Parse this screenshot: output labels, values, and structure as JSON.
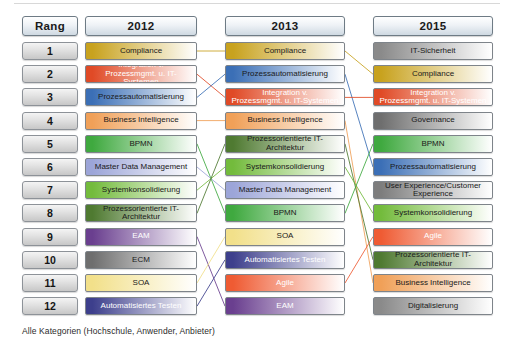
{
  "meta": {
    "footer_note": "Alle Kategorien (Hochschule, Anwender, Anbieter)"
  },
  "headers": {
    "rank": "Rang",
    "year_2012": "2012",
    "year_2013": "2013",
    "year_2015": "2015"
  },
  "ranks": [
    "1",
    "2",
    "3",
    "4",
    "5",
    "6",
    "7",
    "8",
    "9",
    "10",
    "11",
    "12"
  ],
  "chart_data": {
    "type": "table",
    "xlabel": "",
    "ylabel": "Rang",
    "grid": false,
    "legend": "none",
    "categories": [
      "1",
      "2",
      "3",
      "4",
      "5",
      "6",
      "7",
      "8",
      "9",
      "10",
      "11",
      "12"
    ],
    "columns": [
      "Rang",
      "2012",
      "2013",
      "2015"
    ],
    "series": [
      {
        "name": "2012",
        "values": [
          "Compliance",
          "Integration v. Prozessmgmt. u. IT-Systemen",
          "Prozessautomatisierung",
          "Business Intelligence",
          "BPMN",
          "Master Data Management",
          "Systemkonsolidierung",
          "Prozessorientierte IT-Architektur",
          "EAM",
          "ECM",
          "SOA",
          "Automatisiertes Testen"
        ]
      },
      {
        "name": "2013",
        "values": [
          "Compliance",
          "Prozessautomatisierung",
          "Integration v. Prozessmgmt. u. IT-Systemen",
          "Business Intelligence",
          "Prozessorientierte IT-Architektur",
          "Systemkonsolidierung",
          "Master Data Management",
          "BPMN",
          "SOA",
          "Automatisiertes Testen",
          "Agile",
          "EAM"
        ]
      },
      {
        "name": "2015",
        "values": [
          "IT-Sicherheit",
          "Compliance",
          "Integration v. Prozessmgmt. u. IT-Systemen",
          "Governance",
          "BPMN",
          "Prozessautomatisierung",
          "User Experience/Customer Experience",
          "Systemkonsolidierung",
          "Agile",
          "Prozessorientierte IT-Architektur",
          "Business Intelligence",
          "Digitalisierung"
        ]
      }
    ]
  },
  "topic_colors": {
    "Compliance": "#c8a21e",
    "Integration v. Prozessmgmt. u. IT-Systemen": "#e04a26",
    "Prozessautomatisierung": "#3b6fb6",
    "Business Intelligence": "#f0a058",
    "BPMN": "#3fa93f",
    "Master Data Management": "#9ca5d8",
    "Systemkonsolidierung": "#73bb3c",
    "Prozessorientierte IT-Architektur": "#4f7a31",
    "EAM": "#6a3f8f",
    "ECM": "#6e6e6e",
    "SOA": "#f2e08a",
    "Automatisiertes Testen": "#3d3f8c",
    "Agile": "#ef5b33",
    "IT-Sicherheit": "#8a8a8a",
    "Governance": "#6e6e6e",
    "User Experience/Customer Experience": "#7d7d7d",
    "Digitalisierung": "#8a8a8a"
  },
  "topic_text_colors": {
    "Compliance": "#1a1a1a",
    "Integration v. Prozessmgmt. u. IT-Systemen": "#ffffff",
    "Prozessautomatisierung": "#1a1a1a",
    "Business Intelligence": "#1a1a1a",
    "BPMN": "#1a1a1a",
    "Master Data Management": "#1a1a1a",
    "Systemkonsolidierung": "#1a1a1a",
    "Prozessorientierte IT-Architektur": "#1a1a1a",
    "EAM": "#ffffff",
    "ECM": "#1a1a1a",
    "SOA": "#1a1a1a",
    "Automatisiertes Testen": "#ffffff",
    "Agile": "#ffffff",
    "IT-Sicherheit": "#1a1a1a",
    "Governance": "#1a1a1a",
    "User Experience/Customer Experience": "#1a1a1a",
    "Digitalisierung": "#1a1a1a"
  },
  "layout": {
    "header_top": 16,
    "header_height": 20,
    "row_start": 42,
    "row_step": 23.2,
    "bar_height": 18,
    "col_rank_x": 22,
    "col_rank_w": 56,
    "col_2012_x": 85,
    "col_2012_w": 112,
    "col_2013_x": 225,
    "col_2013_w": 120,
    "col_2015_x": 373,
    "col_2015_w": 120
  }
}
